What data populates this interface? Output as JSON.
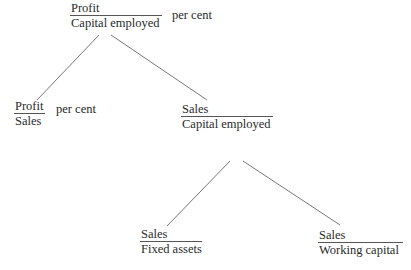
{
  "diagram": {
    "root": {
      "numerator": "Profit",
      "denominator": "Capital employed",
      "suffix": "per cent"
    },
    "level1": [
      {
        "numerator": "Profit",
        "denominator": "Sales",
        "suffix": "per cent"
      },
      {
        "numerator": "Sales",
        "denominator": "Capital employed"
      }
    ],
    "level2": [
      {
        "numerator": "Sales",
        "denominator": "Fixed assets"
      },
      {
        "numerator": "Sales",
        "denominator": "Working capital"
      }
    ],
    "edges": [
      {
        "from": "root",
        "to": "level1.0"
      },
      {
        "from": "root",
        "to": "level1.1"
      },
      {
        "from": "level1.1",
        "to": "level2.0"
      },
      {
        "from": "level1.1",
        "to": "level2.1"
      }
    ]
  }
}
